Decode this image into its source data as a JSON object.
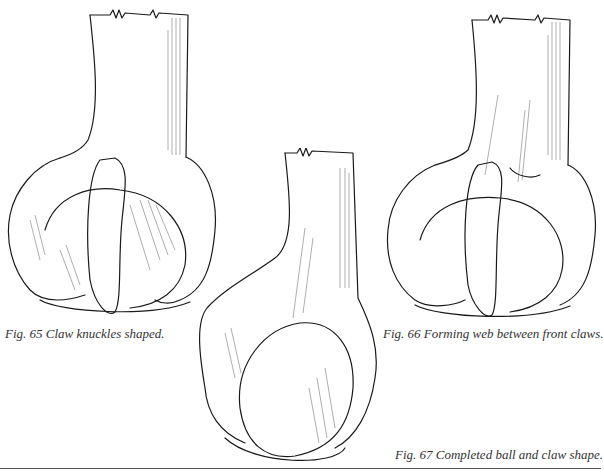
{
  "page": {
    "background": "#ffffff",
    "ink_color": "#1a1a1a"
  },
  "figures": [
    {
      "id": "fig65",
      "number": "Fig. 65",
      "caption": "Fig. 65 Claw knuckles shaped.",
      "subject": "ball-and-claw foot, knuckles shaped"
    },
    {
      "id": "fig67",
      "number": "Fig. 67",
      "caption": "Fig. 67 Completed ball and claw shape.",
      "subject": "ball-and-claw foot, completed"
    },
    {
      "id": "fig66",
      "number": "Fig. 66",
      "caption": "Fig. 66 Forming web between front claws.",
      "subject": "ball-and-claw foot, web between front claws"
    }
  ]
}
